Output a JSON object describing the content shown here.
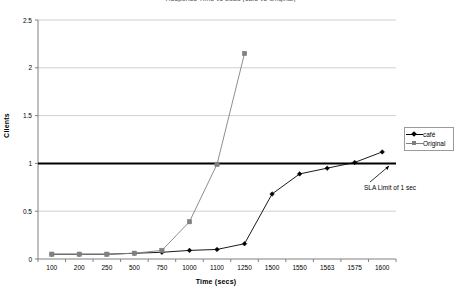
{
  "chart_data": {
    "type": "line",
    "title": "Response Time vs Load (café vs Original)",
    "xlabel": "Time (secs)",
    "ylabel": "Clients",
    "categories": [
      "100",
      "200",
      "250",
      "500",
      "750",
      "1000",
      "1100",
      "1250",
      "1500",
      "1550",
      "1563",
      "1575",
      "1600"
    ],
    "x_tick_labels": [
      "100",
      "200",
      "250",
      "500",
      "750",
      "1000",
      "1100",
      "1250",
      "1500",
      "1550",
      "1563",
      "1575",
      "1600"
    ],
    "y_tick_labels": [
      "0",
      "0.5",
      "1",
      "1.5",
      "2",
      "2.5"
    ],
    "y_tick_values": [
      0,
      0.5,
      1,
      1.5,
      2,
      2.5
    ],
    "ylim": [
      0,
      2.5
    ],
    "grid": true,
    "legend_position": "right",
    "series": [
      {
        "name": "café",
        "color": "#000000",
        "marker": "diamond",
        "values": [
          0.05,
          0.05,
          0.05,
          0.06,
          0.07,
          0.09,
          0.1,
          0.16,
          0.68,
          0.89,
          0.95,
          1.01,
          1.12
        ]
      },
      {
        "name": "Original",
        "color": "#808080",
        "marker": "square",
        "values": [
          0.05,
          0.05,
          0.05,
          0.06,
          0.09,
          0.39,
          0.99,
          2.15,
          null,
          null,
          null,
          null,
          null
        ]
      }
    ],
    "annotations": [
      {
        "text": "SLA Limit of 1 sec",
        "x": 1600,
        "y": 0.95,
        "target_label": "sla-limit-callout"
      }
    ],
    "reference_lines": [
      {
        "name": "SLA Limit",
        "value": 1.0,
        "color": "#000000",
        "width": 2
      }
    ]
  },
  "legend": {
    "items": [
      {
        "label": "café",
        "marker": "diamond-marker",
        "color": "#000000"
      },
      {
        "label": "Original",
        "marker": "square-marker",
        "color": "#808080"
      }
    ]
  }
}
